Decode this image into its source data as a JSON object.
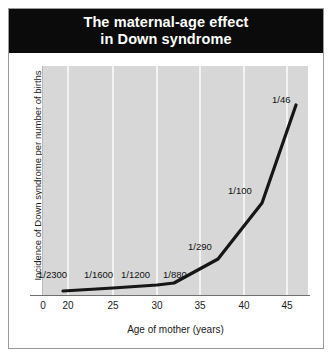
{
  "title": {
    "line1": "The maternal-age effect",
    "line2": "in Down syndrome"
  },
  "axes": {
    "xlabel": "Age of mother (years)",
    "ylabel": "Incidence of Down syndrome per number of births"
  },
  "chart_data": {
    "type": "line",
    "title": "The maternal-age effect in Down syndrome",
    "xlabel": "Age of mother (years)",
    "ylabel": "Incidence of Down syndrome per number of births",
    "xlim": [
      17,
      49
    ],
    "ylim": [
      0,
      0.024
    ],
    "grid": "vertical-white-gridlines",
    "legend": "none",
    "x_tick_labels": [
      "0",
      "20",
      "25",
      "30",
      "35",
      "40",
      "45"
    ],
    "x_tick_values": [
      0,
      20,
      25,
      30,
      35,
      40,
      45
    ],
    "x": [
      20,
      25,
      30,
      32,
      37,
      42,
      47
    ],
    "values": [
      0.000435,
      0.000625,
      0.000833,
      0.001136,
      0.003448,
      0.01,
      0.021739
    ],
    "point_labels": [
      "1/2300",
      "1/1600",
      "1/1200",
      "1/880",
      "1/290",
      "1/100",
      "1/46"
    ],
    "series": [
      {
        "name": "Incidence of Down syndrome",
        "point_labels": [
          "1/2300",
          "1/1600",
          "1/1200",
          "1/880",
          "1/290",
          "1/100",
          "1/46"
        ],
        "x": [
          20,
          25,
          30,
          32,
          37,
          42,
          47
        ],
        "values": [
          0.000435,
          0.000625,
          0.000833,
          0.001136,
          0.003448,
          0.01,
          0.021739
        ]
      }
    ],
    "colors": {
      "plot_background": "#d7d7d7",
      "gridline": "#ffffff",
      "line": "#161616",
      "title_band": "#0b0b0b",
      "title_text": "#ffffff"
    }
  },
  "point_labels": [
    {
      "text": "1/2300",
      "left": 38,
      "top": 269
    },
    {
      "text": "1/1600",
      "left": 84,
      "top": 269
    },
    {
      "text": "1/1200",
      "left": 121,
      "top": 269
    },
    {
      "text": "1/880",
      "left": 163,
      "top": 269
    },
    {
      "text": "1/290",
      "left": 188,
      "top": 241
    },
    {
      "text": "1/100",
      "left": 228,
      "top": 185
    },
    {
      "text": "1/46",
      "left": 272,
      "top": 94
    }
  ],
  "x_ticks": [
    {
      "label": "0",
      "left": 28
    },
    {
      "label": "20",
      "left": 53
    },
    {
      "label": "25",
      "left": 98
    },
    {
      "label": "30",
      "left": 142
    },
    {
      "label": "35",
      "left": 185
    },
    {
      "label": "40",
      "left": 229
    },
    {
      "label": "45",
      "left": 272
    }
  ]
}
